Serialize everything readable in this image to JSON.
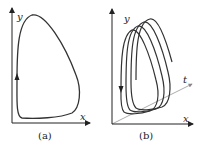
{
  "panels": [
    {
      "id": "a",
      "caption": "(a)",
      "x_label": "x",
      "y_label": "y",
      "description": "closed limit cycle in x-y phase plane"
    },
    {
      "id": "b",
      "caption": "(b)",
      "x_label": "x",
      "y_label": "y",
      "t_label": "t",
      "description": "trajectory spiraling along t axis"
    }
  ],
  "colors": {
    "stroke": "#333333",
    "axis_t": "#888888"
  }
}
